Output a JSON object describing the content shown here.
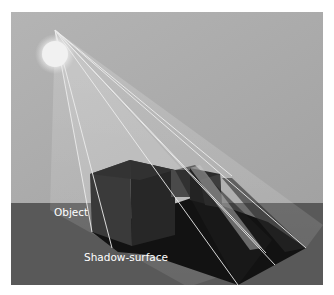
{
  "figure": {
    "labels": {
      "object": "Object",
      "shadow_surface": "Shadow-surface"
    },
    "colors": {
      "sky_top": "#a8a8a8",
      "sky_bottom": "#c4c4c4",
      "ground": "#5a5a5a",
      "shadow": "#141414",
      "object_front": "#333333",
      "object_side": "#262626",
      "light": "#f4f4f4",
      "ray": "#e6e6e6"
    }
  }
}
